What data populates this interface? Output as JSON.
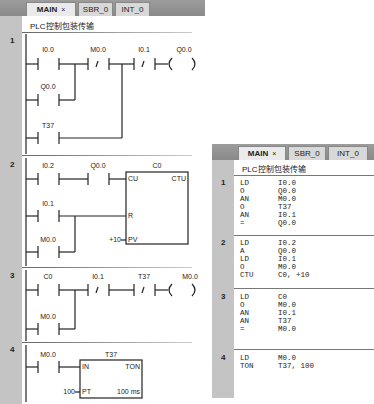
{
  "ladder_editor": {
    "tabs": [
      {
        "label": "MAIN",
        "close": "×",
        "active": true
      },
      {
        "label": "SBR_0",
        "active": false
      },
      {
        "label": "INT_0",
        "active": false
      }
    ],
    "program_comment": "PLC控制包装传输",
    "networks": [
      {
        "number": "1",
        "contacts": [
          {
            "label": "I0.0",
            "type": "NO"
          },
          {
            "label": "M0.0",
            "type": "NC"
          },
          {
            "label": "I0.1",
            "type": "NC"
          },
          {
            "label": "Q0.0",
            "type": "NO",
            "branch": true
          },
          {
            "label": "T37",
            "type": "NO",
            "branch": true
          }
        ],
        "coil": "Q0.0"
      },
      {
        "number": "2",
        "contacts": [
          {
            "label": "I0.2",
            "type": "NO"
          },
          {
            "label": "Q0.0",
            "type": "NO"
          },
          {
            "label": "I0.1",
            "type": "NO"
          },
          {
            "label": "M0.0",
            "type": "NO",
            "branch": true
          }
        ],
        "box": {
          "name": "C0",
          "type": "CTU",
          "pins": [
            "CU",
            "R",
            "PV"
          ],
          "pv_value": "+10"
        }
      },
      {
        "number": "3",
        "contacts": [
          {
            "label": "C0",
            "type": "NO"
          },
          {
            "label": "I0.1",
            "type": "NC"
          },
          {
            "label": "T37",
            "type": "NC"
          },
          {
            "label": "M0.0",
            "type": "NO",
            "branch": true
          }
        ],
        "coil": "M0.0"
      },
      {
        "number": "4",
        "contacts": [
          {
            "label": "M0.0",
            "type": "NO"
          }
        ],
        "box": {
          "name": "T37",
          "type": "TON",
          "pins": [
            "IN",
            "PT"
          ],
          "pt_value": "100",
          "resolution": "100 ms"
        }
      }
    ]
  },
  "stl_editor": {
    "tabs": [
      {
        "label": "MAIN",
        "close": "×",
        "active": true
      },
      {
        "label": "SBR_0",
        "active": false
      },
      {
        "label": "INT_0",
        "active": false
      }
    ],
    "program_comment": "PLC控制包装传输",
    "networks": [
      {
        "number": "1",
        "ops": "LD\nO\nAN\nO\nAN\n=",
        "operands": "I0.0\nQ0.0\nM0.0\nT37\nI0.1\nQ0.0"
      },
      {
        "number": "2",
        "ops": "LD\nA\nLD\nO\nCTU",
        "operands": "I0.2\nQ0.0\nI0.1\nM0.0\nC0, +10"
      },
      {
        "number": "3",
        "ops": "LD\nO\nAN\nAN\n=",
        "operands": "C0\nM0.0\nI0.1\nT37\nM0.0"
      },
      {
        "number": "4",
        "ops": "LD\nTON",
        "operands": "M0.0\nT37, 100"
      }
    ]
  }
}
